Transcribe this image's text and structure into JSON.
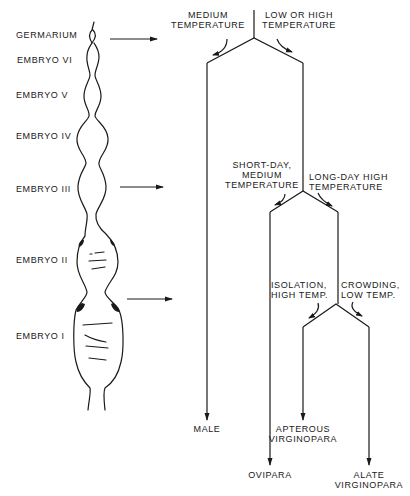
{
  "figure": {
    "stages": [
      {
        "id": "germarium",
        "label": "GERMARIUM"
      },
      {
        "id": "embryo-6",
        "label": "EMBRYO VI"
      },
      {
        "id": "embryo-5",
        "label": "EMBRYO V"
      },
      {
        "id": "embryo-4",
        "label": "EMBRYO IV"
      },
      {
        "id": "embryo-3",
        "label": "EMBRYO III"
      },
      {
        "id": "embryo-2",
        "label": "EMBRYO II"
      },
      {
        "id": "embryo-1",
        "label": "EMBRYO I"
      }
    ],
    "conditions": {
      "medium_temp": [
        "MEDIUM",
        "TEMPERATURE"
      ],
      "low_high_temp": [
        "LOW OR HIGH",
        "TEMPERATURE"
      ],
      "short_day": [
        "SHORT-DAY,",
        "MEDIUM",
        "TEMPERATURE"
      ],
      "long_day": [
        "LONG-DAY HIGH",
        "TEMPERATURE"
      ],
      "isolation": [
        "ISOLATION,",
        "HIGH TEMP."
      ],
      "crowding": [
        "CROWDING,",
        "LOW TEMP."
      ]
    },
    "outcomes": {
      "male": [
        "MALE"
      ],
      "ovipara": [
        "OVIPARA"
      ],
      "apterous": [
        "APTEROUS",
        "VIRGINOPARA"
      ],
      "alate": [
        "ALATE",
        "VIRGINOPARA"
      ]
    },
    "colors": {
      "ink": "#1a1a1a",
      "background": "#ffffff"
    }
  }
}
